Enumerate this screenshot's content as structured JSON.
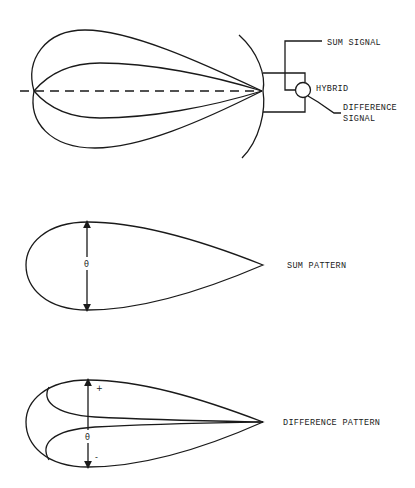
{
  "diagram": {
    "antenna": {
      "labels": {
        "sum_signal": "SUM SIGNAL",
        "hybrid": "HYBRID",
        "difference_signal_line1": "DIFFERENCE",
        "difference_signal_line2": "SIGNAL"
      }
    },
    "sum_pattern": {
      "label": "SUM PATTERN",
      "angle_symbol": "θ"
    },
    "difference_pattern": {
      "label": "DIFFERENCE PATTERN",
      "angle_symbol": "θ",
      "plus_symbol": "+",
      "minus_symbol": "-"
    }
  },
  "colors": {
    "line": "#1a1a1a",
    "background": "#ffffff"
  }
}
